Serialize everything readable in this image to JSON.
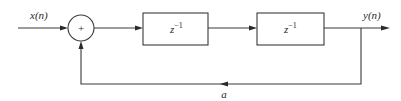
{
  "diagram": {
    "type": "block-diagram",
    "input_label": "x(n)",
    "output_label": "y(n)",
    "summer_symbol": "+",
    "blocks": [
      {
        "base": "z",
        "exponent": "−1"
      },
      {
        "base": "z",
        "exponent": "−1"
      }
    ],
    "feedback_gain_label": "a",
    "colors": {
      "line": "#3a3a3a",
      "text": "#2a2a2a",
      "background": "#ffffff"
    }
  }
}
